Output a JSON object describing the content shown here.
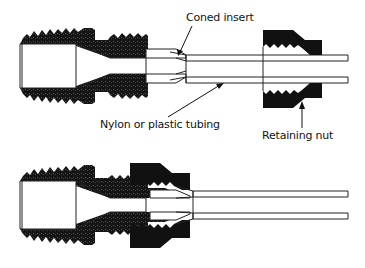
{
  "diagram": {
    "type": "cross-section",
    "panels": [
      {
        "id": "top",
        "state": "exploded",
        "parts": [
          "threaded fitting body",
          "coned insert",
          "nylon or plastic tubing",
          "retaining nut"
        ]
      },
      {
        "id": "bottom",
        "state": "assembled",
        "parts": [
          "threaded fitting body",
          "coned insert",
          "nylon or plastic tubing",
          "retaining nut"
        ]
      }
    ],
    "labels": {
      "coned_insert": "Coned insert",
      "tubing": "Nylon or plastic tubing",
      "retaining_nut": "Retaining nut"
    },
    "colors": {
      "solid": "#111111",
      "outline": "#222222",
      "background": "#ffffff"
    }
  }
}
